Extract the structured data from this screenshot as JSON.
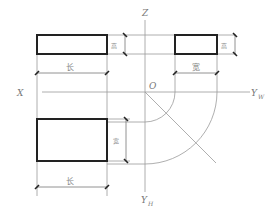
{
  "diagram": {
    "type": "three-view projection (orthographic) with axes",
    "axes": {
      "x_label": "X",
      "z_label": "Z",
      "origin_label": "O",
      "yw_label": "Y",
      "yw_sub": "W",
      "yh_label": "Y",
      "yh_sub": "H"
    },
    "front_view": {
      "width_label": "长",
      "height_label": "高"
    },
    "side_view": {
      "width_label": "宽",
      "height_label": "高"
    },
    "top_view": {
      "width_label": "长",
      "depth_label": "宽"
    },
    "colors": {
      "outline": "#222222",
      "projection_lines": "#9a9a9a",
      "labels": "#777777"
    }
  }
}
